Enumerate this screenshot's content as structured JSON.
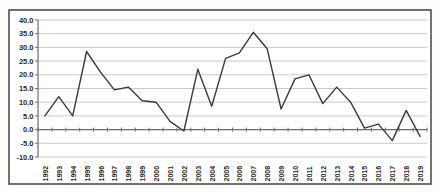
{
  "chart_data": {
    "type": "line",
    "title": "",
    "xlabel": "",
    "ylabel": "",
    "legend": "none",
    "grid": true,
    "x_labels": [
      "1992",
      "1993",
      "1994",
      "1995",
      "1996",
      "1997",
      "1998",
      "1999",
      "2000",
      "2001",
      "2002",
      "2003",
      "2004",
      "2005",
      "2006",
      "2007",
      "2008",
      "2009",
      "2010",
      "2011",
      "2012",
      "2013",
      "2014",
      "2015",
      "2016",
      "2017",
      "2018",
      "2019"
    ],
    "values": [
      5.0,
      12.0,
      5.0,
      28.5,
      21.0,
      14.5,
      15.5,
      10.5,
      10.0,
      3.0,
      -0.5,
      22.0,
      8.5,
      26.0,
      28.0,
      35.5,
      29.5,
      7.5,
      18.5,
      20.0,
      9.5,
      15.5,
      10.0,
      0.5,
      2.0,
      -4.0,
      7.0,
      -2.5
    ],
    "ylim": [
      -10.0,
      40.0
    ],
    "ytick_step": 5.0,
    "ytick_labels": [
      "40.0",
      "35.0",
      "30.0",
      "25.0",
      "20.0",
      "15.0",
      "10.0",
      "5.0",
      "0.0",
      "-5.0",
      "-10.0"
    ],
    "colors": {
      "line": "#3a3a3a",
      "grid": "#bdbdbd",
      "axis": "#6e6e6e",
      "tick": "#6e6e6e",
      "border": "#4f4f4f",
      "label": "#2b2b2b",
      "plot_background": "#ffffff",
      "page_background": "#fdfdfc"
    }
  }
}
